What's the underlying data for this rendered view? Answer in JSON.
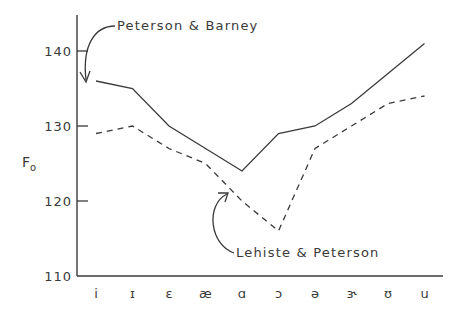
{
  "chart_data": {
    "type": "line",
    "title": "",
    "xlabel": "",
    "ylabel": "F0",
    "ylabel_main": "F",
    "ylabel_sub": "o",
    "ylim": [
      110,
      145
    ],
    "yticks": [
      110,
      120,
      130,
      140
    ],
    "ytick_labels": [
      "110",
      "120",
      "130",
      "140"
    ],
    "grid": false,
    "legend": "none (inline annotations with arrows)",
    "categories": [
      "i",
      "ɪ",
      "ɛ",
      "æ",
      "ɑ",
      "ɔ",
      "ə",
      "ɝ",
      "ʊ",
      "u"
    ],
    "series": [
      {
        "name": "Peterson & Barney",
        "style": "solid",
        "values": [
          136,
          135,
          130,
          127,
          124,
          129,
          130,
          133,
          137,
          141
        ]
      },
      {
        "name": "Lehiste & Peterson",
        "style": "dashed",
        "values": [
          129,
          130,
          127,
          125,
          120,
          116,
          127,
          130,
          133,
          134
        ]
      }
    ],
    "annotations": [
      {
        "text": "Peterson & Barney",
        "points_to": "Peterson & Barney line at i"
      },
      {
        "text": "Lehiste & Peterson",
        "points_to": "Lehiste & Peterson line near ɑ"
      }
    ]
  },
  "labels": {
    "ylabel_main": "F",
    "ylabel_sub": "o",
    "annotation_pb": "Peterson & Barney",
    "annotation_lp": "Lehiste & Peterson"
  },
  "colors": {
    "line": "#3a3a3a",
    "background": "#ffffff"
  }
}
